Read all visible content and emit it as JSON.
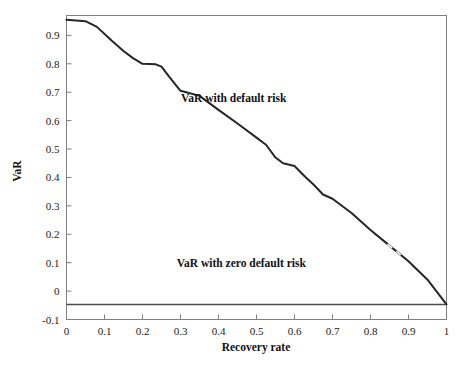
{
  "chart_data": {
    "type": "line",
    "title": "",
    "xlabel": "Recovery rate",
    "ylabel": "VaR",
    "xlim": [
      0,
      1
    ],
    "ylim": [
      -0.1,
      0.97
    ],
    "grid": false,
    "legend": "none",
    "xticks": [
      "0",
      "0.1",
      "0.2",
      "0.3",
      "0.4",
      "0.5",
      "0.6",
      "0.7",
      "0.8",
      "0.9",
      "1"
    ],
    "xtick_values": [
      0,
      0.1,
      0.2,
      0.3,
      0.4,
      0.5,
      0.6,
      0.7,
      0.8,
      0.9,
      1
    ],
    "yticks": [
      "-0.1",
      "0",
      "0.1",
      "0.2",
      "0.3",
      "0.4",
      "0.5",
      "0.6",
      "0.7",
      "0.8",
      "0.9"
    ],
    "ytick_values": [
      -0.1,
      0,
      0.1,
      0.2,
      0.3,
      0.4,
      0.5,
      0.6,
      0.7,
      0.8,
      0.9
    ],
    "series": [
      {
        "name": "VaR with default risk",
        "x": [
          0.0,
          0.05,
          0.08,
          0.12,
          0.15,
          0.175,
          0.2,
          0.235,
          0.25,
          0.27,
          0.3,
          0.315,
          0.35,
          0.4,
          0.45,
          0.5,
          0.525,
          0.55,
          0.57,
          0.6,
          0.63,
          0.65,
          0.675,
          0.7,
          0.75,
          0.8,
          0.85,
          0.9,
          0.95,
          1.0
        ],
        "y": [
          0.955,
          0.95,
          0.93,
          0.88,
          0.845,
          0.82,
          0.8,
          0.798,
          0.79,
          0.755,
          0.705,
          0.7,
          0.687,
          0.638,
          0.59,
          0.54,
          0.515,
          0.47,
          0.45,
          0.44,
          0.4,
          0.375,
          0.34,
          0.325,
          0.275,
          0.215,
          0.16,
          0.105,
          0.04,
          -0.047
        ]
      },
      {
        "name": "VaR with zero default risk",
        "x": [
          0.0,
          1.0
        ],
        "y": [
          -0.047,
          -0.047
        ]
      }
    ],
    "annotations": [
      {
        "text": "VaR with default risk",
        "x": 0.44,
        "y": 0.665
      },
      {
        "text": "VaR with zero default risk",
        "x": 0.46,
        "y": 0.085
      }
    ],
    "colors": {
      "curve": "#262626",
      "flat_line": "#4d4d4d",
      "axis": "#808080",
      "text": "#111111",
      "background": "#ffffff"
    }
  }
}
